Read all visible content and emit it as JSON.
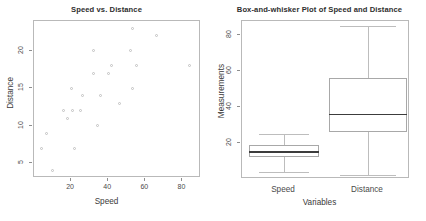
{
  "figure": {
    "background": "#ffffff",
    "point_color": "#c2c2c2",
    "frame_color": "#b9b9b9",
    "median_color": "#3c3c3c",
    "footer_text": ""
  },
  "chart_data": [
    {
      "type": "scatter",
      "title": "Speed vs. Distance",
      "xlabel": "Speed",
      "ylabel": "Distance",
      "xlim": [
        0,
        90
      ],
      "ylim": [
        3,
        24
      ],
      "xticks": [
        20,
        40,
        60,
        80
      ],
      "yticks": [
        5,
        10,
        15,
        20
      ],
      "grid": false,
      "x": [
        4,
        10,
        7,
        22,
        16,
        10,
        18,
        26,
        34,
        17,
        28,
        14,
        20,
        24,
        28,
        26,
        34,
        34,
        46,
        26,
        36,
        60,
        80,
        20,
        26,
        54
      ],
      "y": [
        7,
        4,
        9,
        7,
        12,
        9,
        11,
        14,
        17,
        12,
        14,
        12,
        15,
        12,
        20,
        14,
        17,
        10,
        13,
        14,
        17,
        18,
        18,
        15,
        13,
        23
      ],
      "points": [
        {
          "x": 4,
          "y": 7
        },
        {
          "x": 10,
          "y": 4
        },
        {
          "x": 7,
          "y": 9
        },
        {
          "x": 22,
          "y": 7
        },
        {
          "x": 16,
          "y": 12
        },
        {
          "x": 18,
          "y": 11
        },
        {
          "x": 20,
          "y": 15
        },
        {
          "x": 21,
          "y": 12
        },
        {
          "x": 25,
          "y": 12
        },
        {
          "x": 26,
          "y": 14
        },
        {
          "x": 32,
          "y": 17
        },
        {
          "x": 32,
          "y": 20
        },
        {
          "x": 34,
          "y": 10
        },
        {
          "x": 36,
          "y": 14
        },
        {
          "x": 40,
          "y": 17
        },
        {
          "x": 42,
          "y": 18
        },
        {
          "x": 46,
          "y": 13
        },
        {
          "x": 52,
          "y": 20
        },
        {
          "x": 53,
          "y": 23
        },
        {
          "x": 53,
          "y": 15
        },
        {
          "x": 55,
          "y": 18
        },
        {
          "x": 66,
          "y": 22
        },
        {
          "x": 84,
          "y": 18
        }
      ]
    },
    {
      "type": "box",
      "title": "Box-and-whisker Plot of Speed and Distance",
      "xlabel": "Variables",
      "ylabel": "Measurements",
      "ylim": [
        0,
        88
      ],
      "yticks": [
        20,
        40,
        60,
        80
      ],
      "categories": [
        "Speed",
        "Distance"
      ],
      "boxes": [
        {
          "name": "Speed",
          "min": 4,
          "q1": 12,
          "median": 15,
          "q3": 19,
          "max": 25
        },
        {
          "name": "Distance",
          "min": 2,
          "q1": 26,
          "median": 36,
          "q3": 56,
          "max": 85
        }
      ]
    }
  ]
}
